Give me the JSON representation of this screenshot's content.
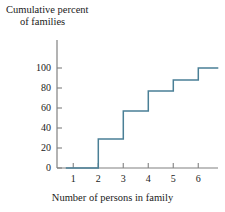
{
  "chart_data": {
    "type": "line",
    "title": "",
    "ylabel_line1": "Cumulative percent",
    "ylabel_line2": "of families",
    "xlabel": "Number of persons in family",
    "x": [
      1,
      2,
      3,
      4,
      5,
      6
    ],
    "values": [
      0,
      29,
      57,
      77,
      88,
      100
    ],
    "step_style": "post",
    "xticks": [
      1,
      2,
      3,
      4,
      5,
      6
    ],
    "xtick_labels": [
      "1",
      "2",
      "3",
      "4",
      "5",
      "6"
    ],
    "yticks": [
      0,
      20,
      40,
      60,
      80,
      100
    ],
    "ytick_labels": [
      "0",
      "20",
      "40",
      "60",
      "80",
      "100"
    ],
    "xlim": [
      0.35,
      6.8
    ],
    "ylim": [
      0,
      118
    ],
    "grid": false,
    "legend": false,
    "line_color": "#4a7f96",
    "axis_color": "#808080",
    "text_color": "#1a1a1a",
    "annotations": []
  }
}
